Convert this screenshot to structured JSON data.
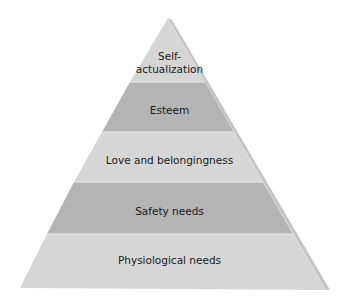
{
  "diagram": {
    "type": "pyramid",
    "title": "",
    "levels": [
      {
        "label_line1": "Self-",
        "label_line2": "actualization",
        "fill": "#d6d6d6"
      },
      {
        "label": "Esteem",
        "fill": "#b4b4b4"
      },
      {
        "label": "Love and belongingness",
        "fill": "#d6d6d6"
      },
      {
        "label": "Safety needs",
        "fill": "#b4b4b4"
      },
      {
        "label": "Physiological needs",
        "fill": "#d6d6d6"
      }
    ],
    "shade_color": "#c4c4c4"
  }
}
